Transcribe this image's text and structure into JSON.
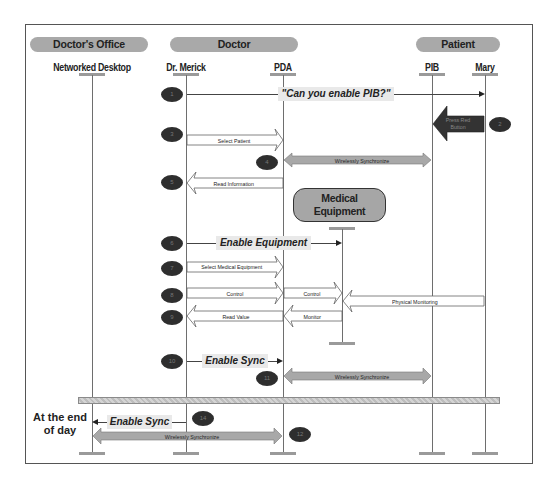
{
  "diagram": {
    "type": "sequence-diagram",
    "groups": [
      {
        "label": "Doctor's Office"
      },
      {
        "label": "Doctor"
      },
      {
        "label": "Patient"
      }
    ],
    "actors": [
      {
        "id": "desktop",
        "label": "Networked Desktop"
      },
      {
        "id": "merick",
        "label": "Dr. Merick"
      },
      {
        "id": "pda",
        "label": "PDA"
      },
      {
        "id": "pib",
        "label": "PIB"
      },
      {
        "id": "mary",
        "label": "Mary"
      }
    ],
    "medical_equipment": {
      "line1": "Medical",
      "line2": "Equipment"
    },
    "steps": [
      {
        "number": "1",
        "from": "Dr. Merick",
        "to": "Mary",
        "label": "\"Can you enable PIB?\"",
        "style": "thin-line"
      },
      {
        "number": "2",
        "from": "Mary",
        "to": "PIB",
        "label_line1": "Press Red",
        "label_line2": "Button",
        "style": "dark-block-arrow"
      },
      {
        "number": "3",
        "from": "Dr. Merick",
        "to": "PDA",
        "label": "Select Patient",
        "style": "hollow-arrow"
      },
      {
        "number": "4",
        "from": "PDA",
        "to": "PIB",
        "label": "Wirelessly Synchronize",
        "style": "gray-double-arrow"
      },
      {
        "number": "5",
        "from": "PDA",
        "to": "Dr. Merick",
        "label": "Read Information",
        "style": "hollow-arrow"
      },
      {
        "number": "6",
        "from": "Dr. Merick",
        "to": "Medical Equipment",
        "label": "Enable Equipment",
        "style": "thin-line"
      },
      {
        "number": "7",
        "from": "Dr. Merick",
        "to": "PDA",
        "label": "Select Medical Equipment",
        "style": "hollow-arrow"
      },
      {
        "number": "8",
        "from": "Dr. Merick",
        "to": "Medical Equipment",
        "label": "Control",
        "label2": "Control",
        "style": "hollow-arrow"
      },
      {
        "number": "8b",
        "from": "Mary",
        "to": "Medical Equipment",
        "label": "Physical Monitoring",
        "style": "hollow-arrow"
      },
      {
        "number": "9",
        "from": "Medical Equipment",
        "to": "Dr. Merick",
        "label": "Read Value",
        "label2": "Monitor",
        "style": "hollow-arrow"
      },
      {
        "number": "10",
        "from": "Dr. Merick",
        "to": "PDA",
        "label": "Enable Sync",
        "style": "thin-line"
      },
      {
        "number": "11",
        "from": "PDA",
        "to": "PIB",
        "label": "Wirelessly Synchronize",
        "style": "gray-double-arrow"
      },
      {
        "number": "14",
        "from": "Dr. Merick",
        "to": "Networked Desktop",
        "label": "Enable Sync",
        "style": "thin-line"
      },
      {
        "number": "12",
        "from": "Networked Desktop",
        "to": "PDA",
        "label": "Wirelessly Synchronize",
        "style": "gray-double-arrow"
      }
    ],
    "side_note": {
      "line1": "At the end",
      "line2": "of day"
    },
    "colors": {
      "group_fill": "#a9a9a9",
      "step_badge": "#2e2e2e",
      "sync_arrow": "#a8a8a8",
      "lifeline": "#6e6e6e",
      "label_bg": "#e9e9e9"
    }
  }
}
